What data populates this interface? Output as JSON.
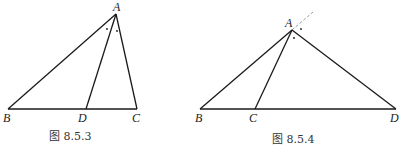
{
  "figures": [
    {
      "caption": "图 8.5.3",
      "points": {
        "A": {
          "label": "A",
          "x": 116,
          "y": 14
        },
        "B": {
          "label": "B",
          "x": 8,
          "y": 109
        },
        "D": {
          "label": "D",
          "x": 86,
          "y": 109
        },
        "C": {
          "label": "C",
          "x": 137,
          "y": 109
        }
      },
      "segments": [
        "AB",
        "AC",
        "AD",
        "BC"
      ],
      "angle_marks": "AD bisects angle BAC (interior angle bisector)"
    },
    {
      "caption": "图 8.5.4",
      "points": {
        "A": {
          "label": "A",
          "x": 292,
          "y": 30
        },
        "B": {
          "label": "B",
          "x": 200,
          "y": 109
        },
        "C": {
          "label": "C",
          "x": 255,
          "y": 109
        },
        "D": {
          "label": "D",
          "x": 396,
          "y": 109
        }
      },
      "segments": [
        "AB",
        "AC",
        "AD",
        "BD"
      ],
      "dashed": "extension of BA beyond A",
      "angle_marks": "AC bisects exterior angle at A"
    }
  ],
  "labels": {
    "fig1": {
      "A": "A",
      "B": "B",
      "D": "D",
      "C": "C",
      "caption": "图 8.5.3"
    },
    "fig2": {
      "A": "A",
      "B": "B",
      "C": "C",
      "D": "D",
      "caption": "图 8.5.4"
    }
  },
  "colors": {
    "stroke": "#1a1a1a",
    "dashed": "#9a9a9a",
    "text": "#222222"
  }
}
